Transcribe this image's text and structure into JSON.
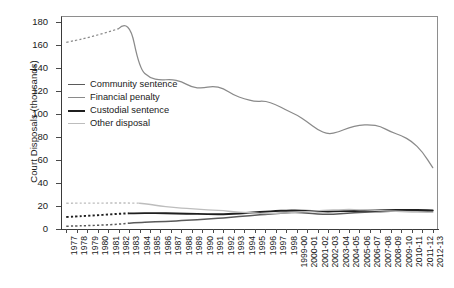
{
  "chart_data": {
    "type": "line",
    "title": "",
    "xlabel": "",
    "ylabel": "Court Disposals (thousands)",
    "ylim": [
      0,
      185
    ],
    "yticks": [
      0,
      20,
      40,
      60,
      80,
      100,
      120,
      140,
      160,
      180
    ],
    "grid": false,
    "legend_position": "upper-left-inside",
    "categories": [
      "1977",
      "1978",
      "1979",
      "1980",
      "1981",
      "1982",
      "1983",
      "1984",
      "1985",
      "1986",
      "1987",
      "1988",
      "1989",
      "1990",
      "1991",
      "1992",
      "1993",
      "1994",
      "1995",
      "1996",
      "1997",
      "1998",
      "1999-00",
      "2000-01",
      "2001-02",
      "2002-03",
      "2003-04",
      "2004-05",
      "2005-06",
      "2006-07",
      "2007-08",
      "2008-09",
      "2009-10",
      "2010-11",
      "2011-12",
      "2012-13"
    ],
    "series": [
      {
        "name": "Community sentence",
        "color": "#5a5a5a",
        "dashed_until_index": 6,
        "values": [
          2.0,
          2.2,
          2.5,
          2.8,
          3.2,
          3.8,
          4.6,
          5.2,
          5.6,
          6.0,
          6.4,
          6.8,
          7.4,
          8.0,
          8.6,
          9.2,
          10.0,
          10.8,
          11.6,
          12.4,
          13.0,
          13.6,
          14.2,
          13.4,
          12.6,
          12.2,
          12.8,
          13.4,
          14.0,
          14.4,
          14.8,
          15.0,
          15.4,
          15.6,
          15.4,
          15.2
        ]
      },
      {
        "name": "Financial penalty",
        "color": "#8a8a8a",
        "dashed_until_index": 5,
        "values": [
          162,
          164,
          166,
          168.5,
          171,
          174,
          183,
          139,
          131,
          129,
          130,
          128,
          123,
          122,
          124,
          122,
          116,
          113,
          110.5,
          111,
          108,
          103,
          99,
          93,
          86,
          82,
          84,
          88,
          90,
          90.5,
          89,
          84,
          81,
          76,
          67,
          53
        ]
      },
      {
        "name": "Custodial sentence",
        "color": "#1f1f1f",
        "dashed_until_index": 6,
        "values": [
          10.0,
          10.5,
          11.0,
          11.6,
          12.2,
          12.8,
          13.2,
          13.4,
          13.4,
          13.3,
          13.2,
          13.0,
          12.8,
          12.6,
          12.4,
          12.4,
          12.8,
          13.4,
          14.0,
          14.6,
          15.2,
          15.6,
          15.8,
          15.4,
          15.0,
          14.8,
          15.0,
          15.2,
          15.4,
          15.6,
          15.8,
          16.0,
          16.2,
          16.2,
          16.0,
          15.8
        ]
      },
      {
        "name": "Other disposal",
        "color": "#bdbdbd",
        "dashed_until_index": 7,
        "values": [
          22.0,
          22.0,
          22.1,
          22.1,
          22.2,
          22.2,
          22.2,
          22.0,
          21.0,
          19.5,
          18.5,
          17.8,
          17.2,
          16.6,
          16.0,
          15.4,
          14.6,
          14.0,
          13.4,
          13.0,
          13.2,
          13.6,
          14.2,
          14.8,
          15.4,
          16.0,
          16.4,
          16.6,
          16.4,
          16.0,
          15.6,
          15.2,
          14.8,
          14.4,
          14.2,
          14.0
        ]
      }
    ]
  },
  "legend": {
    "items": [
      {
        "label": "Community sentence",
        "color": "#5a5a5a",
        "thickness": 1.6
      },
      {
        "label": "Financial penalty",
        "color": "#8a8a8a",
        "thickness": 1.3
      },
      {
        "label": "Custodial sentence",
        "color": "#1f1f1f",
        "thickness": 2.0
      },
      {
        "label": "Other disposal",
        "color": "#bdbdbd",
        "thickness": 1.3
      }
    ]
  }
}
